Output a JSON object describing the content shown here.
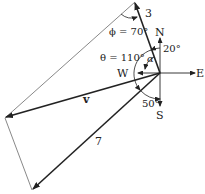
{
  "vectors": {
    "a": {
      "label": "3"
    },
    "b": {
      "label": "7"
    },
    "resultant": {
      "label": "v"
    }
  },
  "compass": {
    "north": "N",
    "south": "S",
    "east": "E",
    "west": "W"
  },
  "angles": {
    "phi": "ϕ = 70°",
    "theta": "θ = 110°",
    "alpha": "α",
    "north_offset": "20°",
    "south_offset": "50°"
  }
}
